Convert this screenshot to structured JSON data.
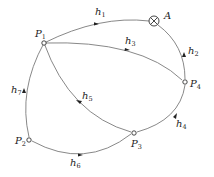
{
  "diagram": {
    "type": "directed-network",
    "nodes": [
      {
        "id": "P1",
        "label": "P",
        "sub": "1",
        "x": 44,
        "y": 43
      },
      {
        "id": "A",
        "label": "A",
        "sub": "",
        "x": 154,
        "y": 21
      },
      {
        "id": "P4",
        "label": "P",
        "sub": "4",
        "x": 185,
        "y": 82
      },
      {
        "id": "P3",
        "label": "P",
        "sub": "3",
        "x": 134,
        "y": 133
      },
      {
        "id": "P2",
        "label": "P",
        "sub": "2",
        "x": 29,
        "y": 140
      }
    ],
    "edges": [
      {
        "id": "h1",
        "label": "h",
        "sub": "1",
        "from": "P1",
        "to": "A"
      },
      {
        "id": "h2",
        "label": "h",
        "sub": "2",
        "from": "P4",
        "to": "A"
      },
      {
        "id": "h3",
        "label": "h",
        "sub": "3",
        "from": "P1",
        "to": "P4"
      },
      {
        "id": "h4",
        "label": "h",
        "sub": "4",
        "from": "P3",
        "to": "P4"
      },
      {
        "id": "h5",
        "label": "h",
        "sub": "5",
        "from": "P3",
        "to": "P1"
      },
      {
        "id": "h6",
        "label": "h",
        "sub": "6",
        "from": "P2",
        "to": "P3"
      },
      {
        "id": "h7",
        "label": "h",
        "sub": "7",
        "from": "P2",
        "to": "P1"
      }
    ]
  },
  "labels": {
    "P1": {
      "main": "P",
      "sub": "1"
    },
    "P2": {
      "main": "P",
      "sub": "2"
    },
    "P3": {
      "main": "P",
      "sub": "3"
    },
    "P4": {
      "main": "P",
      "sub": "4"
    },
    "A": {
      "main": "A"
    },
    "h1": {
      "main": "h",
      "sub": "1"
    },
    "h2": {
      "main": "h",
      "sub": "2"
    },
    "h3": {
      "main": "h",
      "sub": "3"
    },
    "h4": {
      "main": "h",
      "sub": "4"
    },
    "h5": {
      "main": "h",
      "sub": "5"
    },
    "h6": {
      "main": "h",
      "sub": "6"
    },
    "h7": {
      "main": "h",
      "sub": "7"
    }
  }
}
